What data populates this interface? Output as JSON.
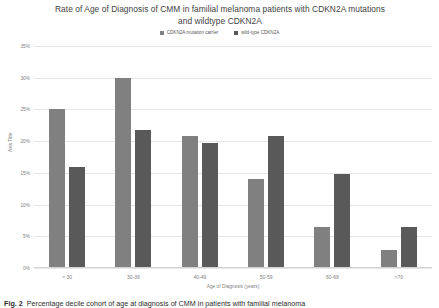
{
  "chart_data": {
    "type": "bar",
    "title": "Rate of Age of Diagnosis of CMM in familial melanoma patients with CDKN2A mutations and wildtype CDKN2A",
    "xlabel": "Age of Diagnosis (years)",
    "ylabel": "Axis Title",
    "categories": [
      "< 30",
      "30-39",
      "40-49",
      "50-59",
      "60-69",
      ">70"
    ],
    "series": [
      {
        "name": "CDKN2A mutation carrier",
        "color": "#808080",
        "values": [
          25.0,
          30.0,
          20.8,
          14.0,
          6.5,
          2.8
        ]
      },
      {
        "name": "wild-type CDKN2A",
        "color": "#595959",
        "values": [
          16.0,
          21.7,
          19.7,
          20.8,
          14.8,
          6.5
        ]
      }
    ],
    "ylim": [
      0,
      35
    ],
    "ytick_labels": [
      "35%",
      "30%",
      "25%",
      "20%",
      "15%",
      "10%",
      "5%",
      "0%"
    ],
    "ytick_values": [
      35,
      30,
      25,
      20,
      15,
      10,
      5,
      0
    ],
    "grid": true,
    "legend_position": "top"
  },
  "caption": {
    "label": "Fig. 2",
    "text": "Percentage decile cohort of age at diagnosis of CMM in patients with familial melanoma"
  }
}
